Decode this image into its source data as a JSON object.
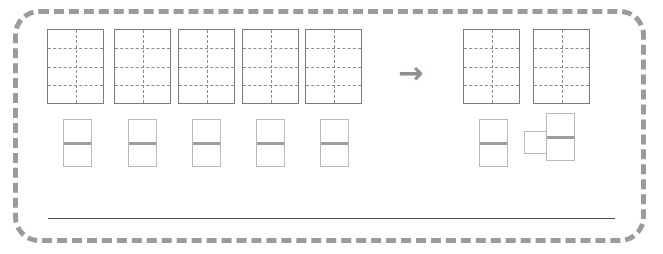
{
  "worksheet": {
    "frame": {
      "border_color": "#9b9b9b",
      "border_style": "dashed",
      "background": "#ffffff"
    },
    "arrow": {
      "glyph": "→",
      "name": "right-arrow",
      "color": "#8f8f8f"
    },
    "answer_line": {
      "label": "",
      "color": "#4f4f4f"
    },
    "colors": {
      "block_outline": "#7b7b7b",
      "block_grid": "#8d8d8d",
      "half_outline": "#b9b9b9",
      "half_rule": "#9e9e9e",
      "frame": "#9b9b9b",
      "arrow": "#8f8f8f",
      "answer_line": "#4f4f4f"
    },
    "left_group": {
      "name": "starting-quantity",
      "large_blocks": [
        {
          "label": "block-1",
          "x": 47,
          "y": 29,
          "w": 57,
          "h": 75,
          "cols": 2,
          "rows": 4,
          "cells": 8
        },
        {
          "label": "block-2",
          "x": 114,
          "y": 29,
          "w": 57,
          "h": 75,
          "cols": 2,
          "rows": 4,
          "cells": 8
        },
        {
          "label": "block-3",
          "x": 178,
          "y": 29,
          "w": 57,
          "h": 75,
          "cols": 2,
          "rows": 4,
          "cells": 8
        },
        {
          "label": "block-4",
          "x": 242,
          "y": 29,
          "w": 57,
          "h": 75,
          "cols": 2,
          "rows": 4,
          "cells": 8
        },
        {
          "label": "block-5",
          "x": 305,
          "y": 29,
          "w": 57,
          "h": 75,
          "cols": 2,
          "rows": 4,
          "cells": 8
        }
      ],
      "small_blocks": [
        {
          "label": "half-1",
          "x": 63,
          "y": 119,
          "w": 29,
          "h": 48,
          "rows": 2
        },
        {
          "label": "half-2",
          "x": 128,
          "y": 119,
          "w": 29,
          "h": 48,
          "rows": 2
        },
        {
          "label": "half-3",
          "x": 192,
          "y": 119,
          "w": 29,
          "h": 48,
          "rows": 2
        },
        {
          "label": "half-4",
          "x": 256,
          "y": 119,
          "w": 29,
          "h": 48,
          "rows": 2
        },
        {
          "label": "half-5",
          "x": 320,
          "y": 119,
          "w": 29,
          "h": 48,
          "rows": 2
        }
      ],
      "large_count": 5,
      "small_count": 5
    },
    "right_group": {
      "name": "resulting-quantity",
      "large_blocks": [
        {
          "label": "block-6",
          "x": 463,
          "y": 29,
          "w": 57,
          "h": 75,
          "cols": 2,
          "rows": 4,
          "cells": 8
        },
        {
          "label": "block-7",
          "x": 533,
          "y": 29,
          "w": 57,
          "h": 75,
          "cols": 2,
          "rows": 4,
          "cells": 8
        }
      ],
      "small_blocks": [
        {
          "label": "half-6",
          "x": 479,
          "y": 119,
          "w": 29,
          "h": 48,
          "rows": 2
        },
        {
          "label": "half-7",
          "x": 546,
          "y": 113,
          "w": 29,
          "h": 48,
          "rows": 2
        }
      ],
      "extra_squares": [
        {
          "label": "square-1",
          "x": 524,
          "y": 131,
          "w": 23,
          "h": 23
        }
      ],
      "large_count": 2,
      "small_count": 2,
      "square_count": 1
    }
  }
}
